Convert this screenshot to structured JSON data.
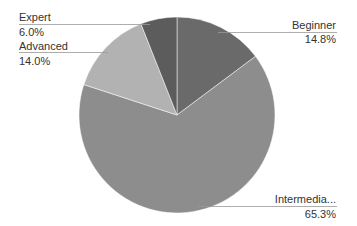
{
  "chart_data": {
    "type": "pie",
    "title": "",
    "legend": "none",
    "labels_position": "outside_with_leader_lines",
    "start_angle_deg": 0,
    "direction": "clockwise",
    "slices": [
      {
        "label": "Beginner",
        "display_label": "Beginner",
        "value": 14.8,
        "pct_text": "14.8%",
        "color": "#6a6a6a"
      },
      {
        "label": "Intermediate",
        "display_label": "Intermedia...",
        "value": 65.3,
        "pct_text": "65.3%",
        "color": "#8d8d8d"
      },
      {
        "label": "Advanced",
        "display_label": "Advanced",
        "value": 14.0,
        "pct_text": "14.0%",
        "color": "#b2b2b2"
      },
      {
        "label": "Expert",
        "display_label": "Expert",
        "value": 6.0,
        "pct_text": "6.0%",
        "color": "#5c5c5c"
      }
    ]
  },
  "labels": {
    "beginner": {
      "name": "Beginner",
      "pct": "14.8%"
    },
    "intermediate": {
      "name": "Intermedia...",
      "pct": "65.3%"
    },
    "advanced": {
      "name": "Advanced",
      "pct": "14.0%"
    },
    "expert": {
      "name": "Expert",
      "pct": "6.0%"
    }
  }
}
